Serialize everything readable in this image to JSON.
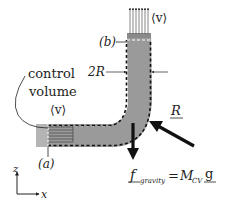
{
  "figure": {
    "labels": {
      "control_volume_line1": "control",
      "control_volume_line2": "volume",
      "velocity_inlet": "⟨v⟩",
      "velocity_outlet": "⟨v⟩",
      "section_a": "(a)",
      "section_b": "(b)",
      "diameter": "2R",
      "reaction_force": "R",
      "gravity_f": "f",
      "gravity_sub": "gravity",
      "equals": "=",
      "mass": "M",
      "mass_sub": "CV",
      "g": "g",
      "axis_z": "z",
      "axis_x": "x"
    },
    "colors": {
      "pipe_fill": "#9a9a9a",
      "stub_fill": "#b4b4b4",
      "dashed_boundary": "#111111",
      "arrow": "#111111",
      "text": "#222222"
    }
  }
}
